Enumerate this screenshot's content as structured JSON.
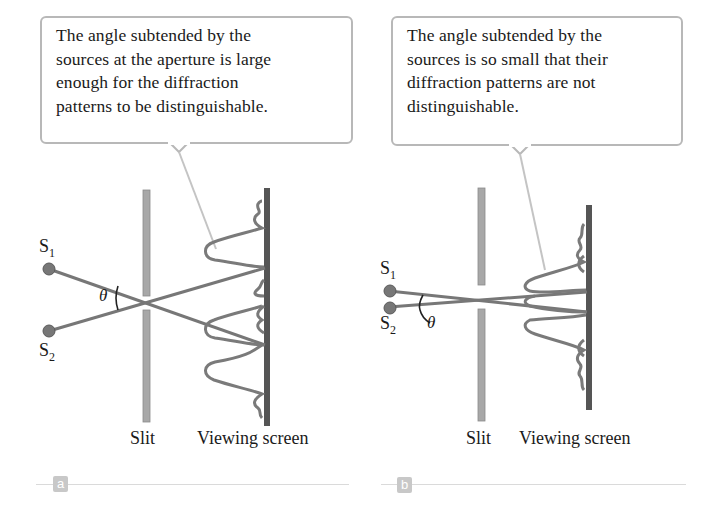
{
  "panels": [
    {
      "id": "a",
      "callout_lines": [
        "The angle subtended by the",
        "sources at the aperture is large",
        "enough for the diffraction",
        "patterns to be distinguishable."
      ],
      "source1_label": "S",
      "source1_sub": "1",
      "source2_label": "S",
      "source2_sub": "2",
      "angle_label": "θ",
      "slit_label": "Slit",
      "screen_label": "Viewing screen",
      "badge": "a"
    },
    {
      "id": "b",
      "callout_lines": [
        "The angle subtended by the",
        "sources is so small that their",
        "diffraction patterns are not",
        "distinguishable."
      ],
      "source1_label": "S",
      "source1_sub": "1",
      "source2_label": "S",
      "source2_sub": "2",
      "angle_label": "θ",
      "slit_label": "Slit",
      "screen_label": "Viewing screen",
      "badge": "b"
    }
  ],
  "colors": {
    "ray": "#777777",
    "slit": "#a8a8a8",
    "screen": "#555555",
    "callout_border": "#b8b8b8",
    "badge": "#c8c8c8"
  }
}
